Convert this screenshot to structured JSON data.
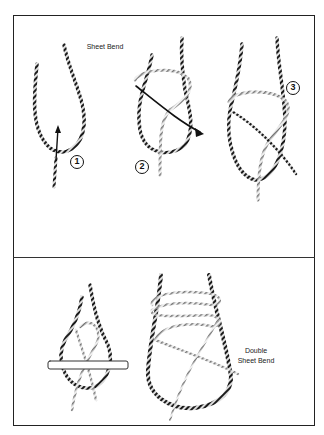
{
  "figure": {
    "top_panel": {
      "title": "Sheet Bend",
      "steps": [
        {
          "number": "1"
        },
        {
          "number": "2"
        },
        {
          "number": "3"
        }
      ]
    },
    "bottom_panel": {
      "label_line1": "Double",
      "label_line2": "Sheet Bend"
    }
  },
  "colors": {
    "rope_dark": "#222222",
    "rope_light": "#888888",
    "frame": "#222222"
  }
}
